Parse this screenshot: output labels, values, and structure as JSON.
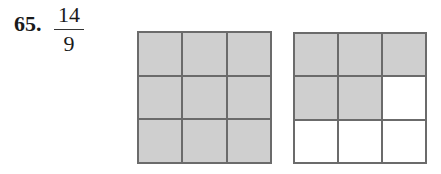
{
  "problem": {
    "number": "65.",
    "fraction": {
      "numerator": "14",
      "denominator": "9"
    }
  },
  "figures": [
    {
      "name": "grid-1",
      "rows": 3,
      "cols": 3,
      "shaded": [
        1,
        1,
        1,
        1,
        1,
        1,
        1,
        1,
        1
      ]
    },
    {
      "name": "grid-2",
      "rows": 3,
      "cols": 3,
      "shaded": [
        1,
        1,
        1,
        1,
        1,
        0,
        0,
        0,
        0
      ]
    }
  ],
  "colors": {
    "shaded": "#cfcfcf",
    "empty": "#ffffff",
    "line": "#6b6b6b"
  }
}
